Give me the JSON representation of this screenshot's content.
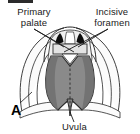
{
  "figure": {
    "panel_letter": "A",
    "background_color": "#ffffff",
    "width": 140,
    "height": 134,
    "top_rule_color": "#2b2b2b",
    "labels": {
      "primary_palate": {
        "line1": "Primary",
        "line2": "palate",
        "text": "Primary palate",
        "color": "#1a1a1a"
      },
      "incisive_foramen": {
        "line1": "Incisive",
        "line2": "foramen",
        "text": "Incisive foramen",
        "color": "#1a1a1a"
      },
      "uvula": {
        "text": "Uvula",
        "color": "#1a1a1a"
      }
    },
    "anatomy": {
      "soft_palate_fill": "#8a8a8a",
      "soft_palate_edge_fill": "#6f6f6f",
      "hard_palate_fill": "#efefef",
      "premaxilla_fill": "#e3e3e3",
      "cheek_fill": "#fbfbfb",
      "foramen_fill": "#0d0d0d",
      "outline_color": "#2a2a2a",
      "midline_style": "dashed",
      "midline_color": "#3a3a3a"
    }
  }
}
